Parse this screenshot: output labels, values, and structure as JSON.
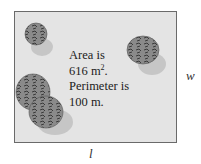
{
  "figure": {
    "caption_lines": [
      "Area is",
      "616 m",
      "Perimeter is",
      "100 m."
    ],
    "area_unit_exponent": "2",
    "area_line_suffix": ".",
    "dimension_width_label": "w",
    "dimension_length_label": "l",
    "colors": {
      "field": "#e4e4e4",
      "border": "#6a6a6a",
      "bush": "#7a7a7a",
      "bush_dark": "#3c3c3c",
      "shadow": "#c4c4c4"
    },
    "bushes": [
      {
        "name": "bush-top-left"
      },
      {
        "name": "bush-top-right"
      },
      {
        "name": "bush-bottom-left"
      }
    ]
  }
}
